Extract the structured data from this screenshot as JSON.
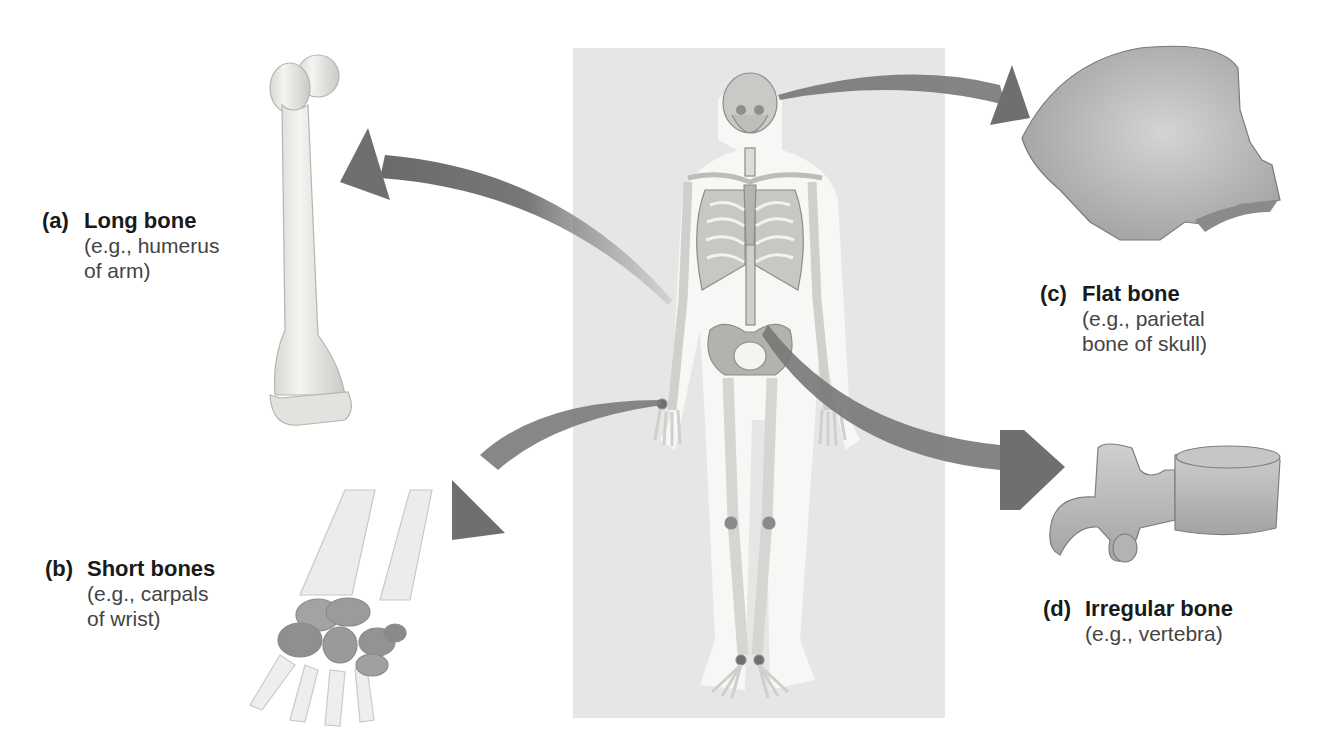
{
  "figure": {
    "central_panel": "Full human skeleton (anterior view)",
    "colors": {
      "background": "#ffffff",
      "panel": "#e6e6e6",
      "arrow": "#6f6f6f",
      "bone": "#e9e9e6",
      "bone_shadow": "#b8b8b5",
      "carpal": "#8f8f8f",
      "text": "#1a1a1a",
      "text_secondary": "#444444"
    },
    "bone_types": [
      {
        "tag": "(a)",
        "title": "Long bone",
        "desc_line1": "(e.g., humerus",
        "desc_line2": "of arm)",
        "icon": "humerus-icon"
      },
      {
        "tag": "(b)",
        "title": "Short bones",
        "desc_line1": "(e.g., carpals",
        "desc_line2": "of wrist)",
        "icon": "carpals-icon"
      },
      {
        "tag": "(c)",
        "title": "Flat bone",
        "desc_line1": "(e.g., parietal",
        "desc_line2": "bone of skull)",
        "icon": "parietal-bone-icon"
      },
      {
        "tag": "(d)",
        "title": "Irregular bone",
        "desc_line1": "(e.g., vertebra)",
        "icon": "vertebra-icon"
      }
    ]
  }
}
